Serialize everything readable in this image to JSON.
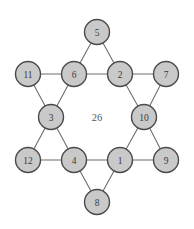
{
  "figure": {
    "kind": "hexagram-magic-star",
    "title": "",
    "center_label": "26",
    "background_color": "#ffffff",
    "node_fill_color": "#c9c9c9",
    "node_border_color": "#4a4a4a",
    "edge_color": "#6e6e6e",
    "label_color": "#3a3a3a",
    "center_label_color": "#55555a",
    "canvas": {
      "width": 194,
      "height": 229
    }
  },
  "nodes": [
    {
      "id": "n5",
      "label": "5",
      "x": 97,
      "y": 32,
      "r": 12.5,
      "role": "outer-point-top"
    },
    {
      "id": "n11",
      "label": "11",
      "x": 28,
      "y": 74,
      "r": 12.5,
      "role": "outer-point-upper-left"
    },
    {
      "id": "n6",
      "label": "6",
      "x": 74,
      "y": 74,
      "r": 12.5,
      "role": "inner-hex-upper-left"
    },
    {
      "id": "n2",
      "label": "2",
      "x": 120,
      "y": 74,
      "r": 12.5,
      "role": "inner-hex-upper-right"
    },
    {
      "id": "n7",
      "label": "7",
      "x": 166,
      "y": 74,
      "r": 12.5,
      "role": "outer-point-upper-right"
    },
    {
      "id": "n3",
      "label": "3",
      "x": 51,
      "y": 117,
      "r": 12.5,
      "role": "inner-hex-left"
    },
    {
      "id": "n10",
      "label": "10",
      "x": 144,
      "y": 117,
      "r": 12.5,
      "role": "inner-hex-right"
    },
    {
      "id": "n12",
      "label": "12",
      "x": 28,
      "y": 160,
      "r": 12.5,
      "role": "outer-point-lower-left"
    },
    {
      "id": "n4",
      "label": "4",
      "x": 74,
      "y": 160,
      "r": 12.5,
      "role": "inner-hex-lower-left"
    },
    {
      "id": "n1",
      "label": "1",
      "x": 120,
      "y": 160,
      "r": 12.5,
      "role": "inner-hex-lower-right"
    },
    {
      "id": "n9",
      "label": "9",
      "x": 166,
      "y": 160,
      "r": 12.5,
      "role": "outer-point-lower-right"
    },
    {
      "id": "n8",
      "label": "8",
      "x": 97,
      "y": 202,
      "r": 12.5,
      "role": "outer-point-bottom"
    }
  ],
  "edges": [
    {
      "from": "n5",
      "to": "n6"
    },
    {
      "from": "n5",
      "to": "n2"
    },
    {
      "from": "n11",
      "to": "n6"
    },
    {
      "from": "n11",
      "to": "n3"
    },
    {
      "from": "n6",
      "to": "n2"
    },
    {
      "from": "n6",
      "to": "n3"
    },
    {
      "from": "n2",
      "to": "n7"
    },
    {
      "from": "n2",
      "to": "n10"
    },
    {
      "from": "n7",
      "to": "n10"
    },
    {
      "from": "n3",
      "to": "n4"
    },
    {
      "from": "n3",
      "to": "n12"
    },
    {
      "from": "n10",
      "to": "n1"
    },
    {
      "from": "n10",
      "to": "n9"
    },
    {
      "from": "n12",
      "to": "n4"
    },
    {
      "from": "n4",
      "to": "n1"
    },
    {
      "from": "n4",
      "to": "n8"
    },
    {
      "from": "n1",
      "to": "n9"
    },
    {
      "from": "n1",
      "to": "n8"
    }
  ],
  "center": {
    "label": "26",
    "x": 97,
    "y": 117
  }
}
